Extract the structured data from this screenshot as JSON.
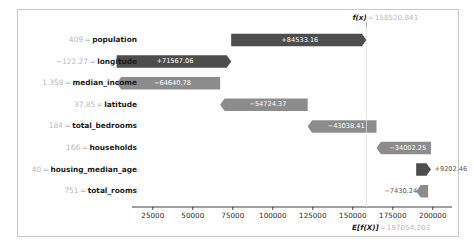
{
  "chart_data": {
    "type": "bar",
    "chart_kind": "shap-waterfall",
    "title": "",
    "xlabel": "",
    "ylabel": "",
    "base_value_label": "E[f(X)]",
    "base_value": 197054.203,
    "base_value_text": "197054.203",
    "output_value_label": "f(x)",
    "output_value": 158520.841,
    "output_value_text": "158520.841",
    "xlim": [
      12000,
      212000
    ],
    "xticks": [
      25000,
      50000,
      75000,
      100000,
      125000,
      150000,
      175000,
      200000
    ],
    "xtick_labels": [
      "25000",
      "50000",
      "75000",
      "100000",
      "125000",
      "150000",
      "175000",
      "200000"
    ],
    "grid": false,
    "legend": null,
    "positive_color": "#4d4d4d",
    "negative_color": "#8c8c8c",
    "features": [
      {
        "name": "population",
        "feature_value": "409",
        "shap_value": 84533.16,
        "shap_label": "+84533.16",
        "sign": "positive",
        "label_placement": "inside"
      },
      {
        "name": "longitude",
        "feature_value": "−122.27",
        "shap_value": 71567.06,
        "shap_label": "+71567.06",
        "sign": "positive",
        "label_placement": "inside"
      },
      {
        "name": "median_income",
        "feature_value": "1.358",
        "shap_value": -64640.78,
        "shap_label": "−64640.78",
        "sign": "negative",
        "label_placement": "inside"
      },
      {
        "name": "latitude",
        "feature_value": "37.85",
        "shap_value": -54724.37,
        "shap_label": "−54724.37",
        "sign": "negative",
        "label_placement": "inside"
      },
      {
        "name": "total_bedrooms",
        "feature_value": "184",
        "shap_value": -43038.41,
        "shap_label": "−43038.41",
        "sign": "negative",
        "label_placement": "inside"
      },
      {
        "name": "households",
        "feature_value": "166",
        "shap_value": -34002.25,
        "shap_label": "−34002.25",
        "sign": "negative",
        "label_placement": "inside"
      },
      {
        "name": "housing_median_age",
        "feature_value": "40",
        "shap_value": 9202.46,
        "shap_label": "+9202.46",
        "sign": "positive",
        "label_placement": "outside-right"
      },
      {
        "name": "total_rooms",
        "feature_value": "751",
        "shap_value": -7430.24,
        "shap_label": "−7430.24",
        "sign": "negative",
        "label_placement": "outside-left"
      }
    ]
  }
}
